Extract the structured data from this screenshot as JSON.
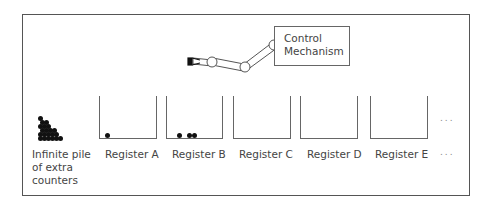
{
  "diagram": {
    "type": "register-machine",
    "control": {
      "label_line1": "Control",
      "label_line2": "Mechanism"
    },
    "pile": {
      "label_line1": "Infinite pile",
      "label_line2": "of extra",
      "label_line3": "counters"
    },
    "registers": [
      {
        "label": "Register A",
        "counters": 1
      },
      {
        "label": "Register B",
        "counters": 3
      },
      {
        "label": "Register C",
        "counters": 0
      },
      {
        "label": "Register D",
        "counters": 0
      },
      {
        "label": "Register E",
        "counters": 0
      }
    ],
    "continuation": {
      "top": "...",
      "bottom": "..."
    }
  }
}
